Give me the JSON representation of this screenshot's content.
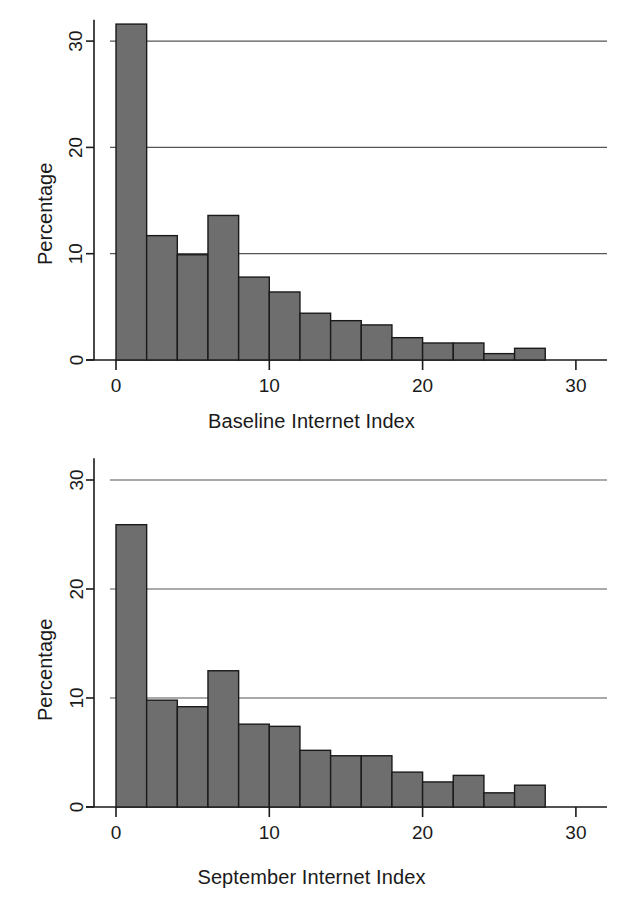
{
  "figure": {
    "background_color": "#ffffff",
    "bar_fill_color": "#6e6e6e",
    "bar_edge_color": "#1a1a1a",
    "gridline_color": "#555555",
    "axis_color": "#1a1a1a"
  },
  "charts": [
    {
      "id": "baseline-internet-index",
      "chart_data": {
        "type": "bar",
        "title": "",
        "subtitle": "",
        "xlabel": "Baseline Internet Index",
        "ylabel": "Percentage",
        "xlim": [
          -1,
          31
        ],
        "ylim": [
          0,
          32
        ],
        "xticks": [
          0,
          10,
          20,
          30
        ],
        "xtick_labels": [
          "0",
          "10",
          "20",
          "30"
        ],
        "yticks": [
          0,
          10,
          20,
          30
        ],
        "ytick_labels": [
          "0",
          "10",
          "20",
          "30"
        ],
        "grid": "horizontal",
        "gridlines_at": [
          10,
          20,
          30
        ],
        "legend": null,
        "bin_width": 2,
        "bin_starts": [
          0,
          2,
          4,
          6,
          8,
          10,
          12,
          14,
          16,
          18,
          20,
          22,
          24,
          26
        ],
        "categories": [
          "0-2",
          "2-4",
          "4-6",
          "6-8",
          "8-10",
          "10-12",
          "12-14",
          "14-16",
          "16-18",
          "18-20",
          "20-22",
          "22-24",
          "24-26",
          "26-28"
        ],
        "values": [
          31.6,
          11.7,
          9.9,
          13.6,
          7.8,
          6.4,
          4.4,
          3.7,
          3.3,
          2.1,
          1.6,
          1.6,
          0.6,
          1.1
        ],
        "x_centers": [
          1,
          3,
          5,
          7,
          9,
          11,
          13,
          15,
          17,
          19,
          21,
          23,
          25,
          27
        ]
      }
    },
    {
      "id": "september-internet-index",
      "chart_data": {
        "type": "bar",
        "title": "",
        "subtitle": "",
        "xlabel": "September Internet Index",
        "ylabel": "Percentage",
        "xlim": [
          -1,
          31
        ],
        "ylim": [
          0,
          32
        ],
        "xticks": [
          0,
          10,
          20,
          30
        ],
        "xtick_labels": [
          "0",
          "10",
          "20",
          "30"
        ],
        "yticks": [
          0,
          10,
          20,
          30
        ],
        "ytick_labels": [
          "0",
          "10",
          "20",
          "30"
        ],
        "grid": "horizontal",
        "gridlines_at": [
          10,
          20,
          30
        ],
        "legend": null,
        "bin_width": 2,
        "bin_starts": [
          0,
          2,
          4,
          6,
          8,
          10,
          12,
          14,
          16,
          18,
          20,
          22,
          24,
          26
        ],
        "categories": [
          "0-2",
          "2-4",
          "4-6",
          "6-8",
          "8-10",
          "10-12",
          "12-14",
          "14-16",
          "16-18",
          "18-20",
          "20-22",
          "22-24",
          "24-26",
          "26-28"
        ],
        "values": [
          25.9,
          9.8,
          9.2,
          12.5,
          7.6,
          7.4,
          5.2,
          4.7,
          4.7,
          3.2,
          2.3,
          2.9,
          1.3,
          2.0
        ],
        "x_centers": [
          1,
          3,
          5,
          7,
          9,
          11,
          13,
          15,
          17,
          19,
          21,
          23,
          25,
          27
        ]
      }
    }
  ]
}
